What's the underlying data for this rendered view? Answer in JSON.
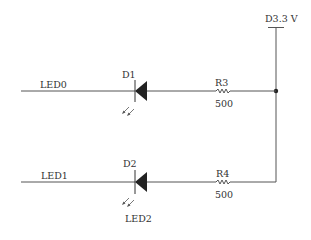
{
  "diagram": {
    "type": "circuit-schematic",
    "supply": {
      "label": "D3.3 V"
    },
    "branches": [
      {
        "net_label": "LED0",
        "diode": {
          "ref": "D1",
          "type": "LED"
        },
        "resistor": {
          "ref": "R3",
          "value": "500"
        }
      },
      {
        "net_label": "LED1",
        "diode": {
          "ref": "D2",
          "type": "LED",
          "part_label": "LED2"
        },
        "resistor": {
          "ref": "R4",
          "value": "500"
        }
      }
    ],
    "colors": {
      "wire": "#555555",
      "component": "#222222",
      "text": "#333333",
      "background": "#ffffff"
    }
  }
}
